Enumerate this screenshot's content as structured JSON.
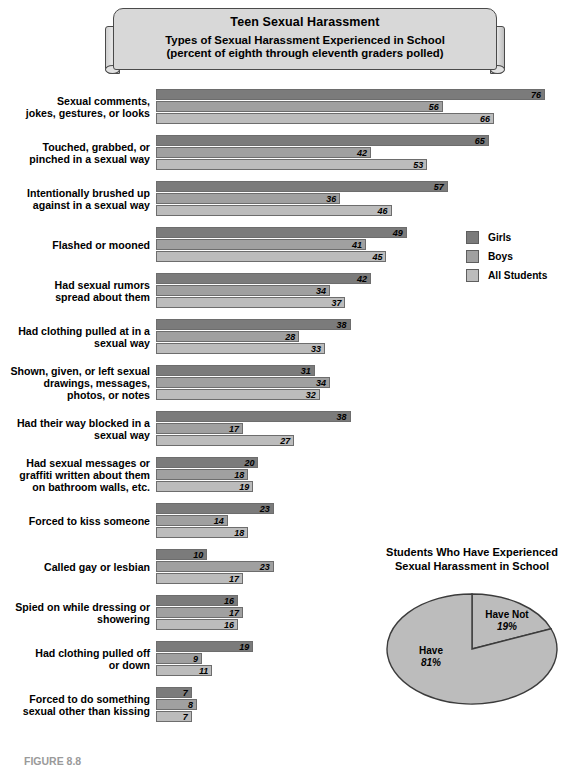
{
  "banner": {
    "title": "Teen Sexual Harassment",
    "subtitle_line1": "Types of Sexual Harassment Experienced in School",
    "subtitle_line2": "(percent of eighth through eleventh graders polled)"
  },
  "legend": {
    "items": [
      {
        "label": "Girls",
        "color": "#7b7b7b"
      },
      {
        "label": "Boys",
        "color": "#a0a0a0"
      },
      {
        "label": "All Students",
        "color": "#bcbcbc"
      }
    ]
  },
  "pie": {
    "title_line1": "Students Who Have Experienced",
    "title_line2": "Sexual Harassment in School",
    "slices": [
      {
        "label": "Have",
        "value_label": "81%"
      },
      {
        "label": "Have Not",
        "value_label": "19%"
      }
    ]
  },
  "caption": "FIGURE 8.8",
  "chart_data": {
    "type": "bar",
    "title": "Teen Sexual Harassment",
    "subtitle": "Types of Sexual Harassment Experienced in School (percent of eighth through eleventh graders polled)",
    "orientation": "horizontal",
    "xlabel": "",
    "ylabel": "",
    "xlim": [
      0,
      80
    ],
    "grid": false,
    "legend_position": "right",
    "categories": [
      "Sexual comments, jokes, gestures, or looks",
      "Touched, grabbed, or pinched in a sexual way",
      "Intentionally brushed up against in a sexual way",
      "Flashed or mooned",
      "Had sexual rumors spread about them",
      "Had clothing pulled at in a sexual way",
      "Shown, given, or left sexual drawings, messages, photos, or notes",
      "Had their way blocked in a sexual way",
      "Had sexual messages or graffiti written about them on bathroom walls, etc.",
      "Forced to kiss someone",
      "Called gay or lesbian",
      "Spied on while dressing or showering",
      "Had clothing pulled off or down",
      "Forced to do something sexual other than kissing"
    ],
    "category_lines": [
      [
        "Sexual comments,",
        "jokes, gestures, or looks"
      ],
      [
        "Touched, grabbed, or",
        "pinched in a sexual way"
      ],
      [
        "Intentionally brushed up",
        "against in a sexual way"
      ],
      [
        "Flashed or mooned"
      ],
      [
        "Had sexual rumors",
        "spread about them"
      ],
      [
        "Had clothing pulled at in a",
        "sexual way"
      ],
      [
        "Shown, given, or left sexual",
        "drawings, messages,",
        "photos, or notes"
      ],
      [
        "Had their way blocked in a",
        "sexual way"
      ],
      [
        "Had sexual messages or",
        "graffiti written about them",
        "on bathroom walls, etc."
      ],
      [
        "Forced to kiss someone"
      ],
      [
        "Called gay or lesbian"
      ],
      [
        "Spied on while dressing or",
        "showering"
      ],
      [
        "Had clothing pulled off",
        "or down"
      ],
      [
        "Forced to do something",
        "sexual other than kissing"
      ]
    ],
    "series": [
      {
        "name": "Girls",
        "color": "#7b7b7b",
        "values": [
          76,
          65,
          57,
          49,
          42,
          38,
          31,
          38,
          20,
          23,
          10,
          16,
          19,
          7
        ]
      },
      {
        "name": "Boys",
        "color": "#a0a0a0",
        "values": [
          56,
          42,
          36,
          41,
          34,
          28,
          34,
          17,
          18,
          14,
          23,
          17,
          9,
          8
        ]
      },
      {
        "name": "All Students",
        "color": "#bcbcbc",
        "values": [
          66,
          53,
          46,
          45,
          37,
          33,
          32,
          27,
          19,
          18,
          17,
          16,
          11,
          7
        ]
      }
    ]
  },
  "pie_data": {
    "type": "pie",
    "title": "Students Who Have Experienced Sexual Harassment in School",
    "labels": [
      "Have",
      "Have Not"
    ],
    "values": [
      81,
      19
    ]
  }
}
